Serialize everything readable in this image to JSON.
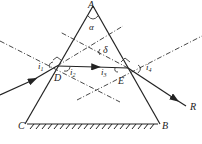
{
  "diagram": {
    "type": "prism-refraction",
    "labels": {
      "A": "A",
      "B": "B",
      "C": "C",
      "D": "D",
      "E": "E",
      "R": "R",
      "alpha": "α",
      "delta": "δ",
      "i1": "i",
      "i1_sub": "1",
      "i2": "i",
      "i2_sub": "2",
      "i3": "i",
      "i3_sub": "3",
      "i4": "i",
      "i4_sub": "4"
    },
    "colors": {
      "stroke": "#222222",
      "background": "#ffffff"
    }
  }
}
